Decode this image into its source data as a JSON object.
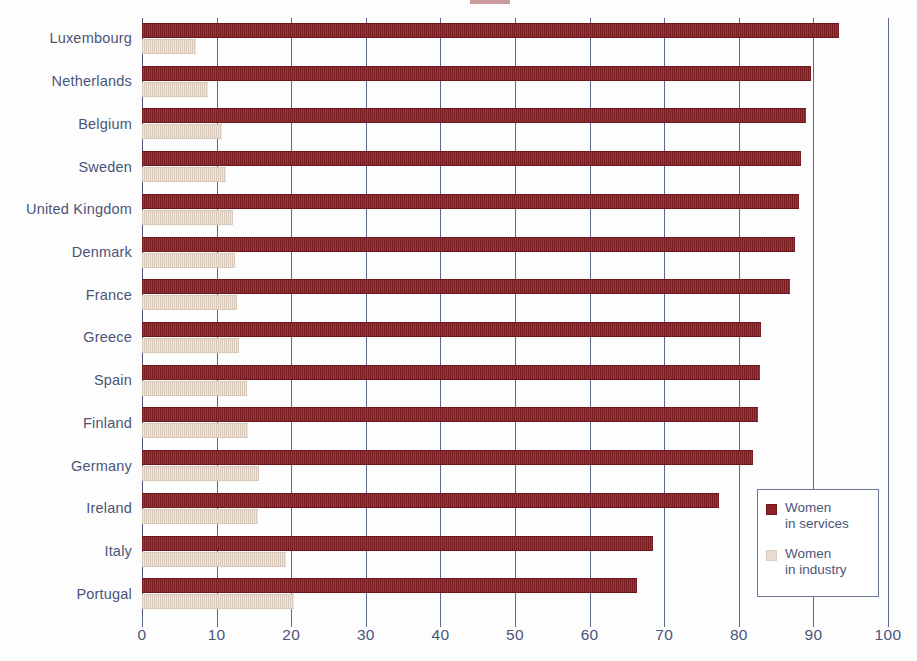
{
  "chart_data": {
    "type": "bar",
    "orientation": "horizontal",
    "title": "",
    "subtitle": "",
    "xlabel": "",
    "ylabel": "",
    "xlim": [
      0,
      100
    ],
    "xticks": [
      0,
      10,
      20,
      30,
      40,
      50,
      60,
      70,
      80,
      90,
      100
    ],
    "xtick_labels": [
      "0",
      "10",
      "20",
      "30",
      "40",
      "50",
      "60",
      "70",
      "80",
      "90",
      "100"
    ],
    "grid": "vertical gridlines at every 10 units",
    "legend_position": "inside lower right",
    "categories": [
      "Luxembourg",
      "Netherlands",
      "Belgium",
      "Sweden",
      "United Kingdom",
      "Denmark",
      "France",
      "Greece",
      "Spain",
      "Finland",
      "Germany",
      "Ireland",
      "Italy",
      "Portugal"
    ],
    "series": [
      {
        "name": "Women in services",
        "color": "#8c2126",
        "values": [
          93.4,
          89.7,
          89.0,
          88.4,
          88.1,
          87.5,
          86.8,
          83.0,
          82.9,
          82.6,
          81.9,
          77.4,
          68.5,
          66.4
        ]
      },
      {
        "name": "Women in industry",
        "color": "#e8dccf",
        "values": [
          7.2,
          8.8,
          10.7,
          11.3,
          12.2,
          12.5,
          12.7,
          13.0,
          14.1,
          14.2,
          15.7,
          15.5,
          19.3,
          20.4
        ]
      }
    ]
  },
  "legend": {
    "items": [
      {
        "label_line1": "Women",
        "label_line2": "in services",
        "swatch": "services"
      },
      {
        "label_line1": "Women",
        "label_line2": "in industry",
        "swatch": "industry"
      }
    ]
  },
  "colors": {
    "services_bar": "#8c2126",
    "industry_bar": "#e8dccf",
    "axis": "#5a6a8c",
    "text": "#4a5578",
    "background": "#fdfdfd"
  }
}
